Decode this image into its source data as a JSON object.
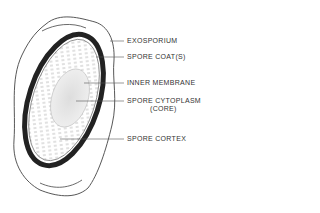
{
  "diagram": {
    "labels": [
      {
        "text": "EXOSPORIUM",
        "y": 41
      },
      {
        "text": "SPORE COAT(S)",
        "y": 57
      },
      {
        "text": "INNER MEMBRANE",
        "y": 83
      },
      {
        "text": "SPORE CYTOPLASM",
        "sub": "(CORE)",
        "y": 101
      },
      {
        "text": "SPORE CORTEX",
        "y": 139
      }
    ]
  }
}
